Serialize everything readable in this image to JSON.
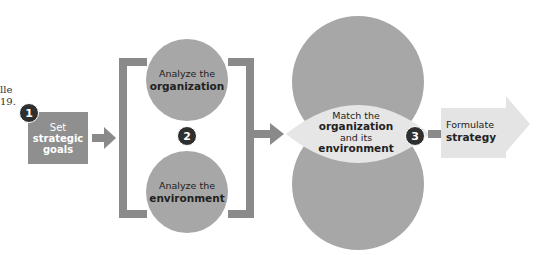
{
  "side_note": {
    "line1": "lle",
    "line2": "19."
  },
  "steps": [
    {
      "number": "1",
      "line1": "Set",
      "line2": "strategic",
      "line3": "goals"
    },
    {
      "number": "2",
      "top": {
        "line1": "Analyze the",
        "line2": "organization"
      },
      "bottom": {
        "line1": "Analyze the",
        "line2": "environment"
      }
    },
    {
      "number": "3",
      "line1": "Match the",
      "line2": "organization",
      "line3": "and its",
      "line4": "environment"
    },
    {
      "line1": "Formulate",
      "line2": "strategy"
    }
  ],
  "colors": {
    "box": "#8f8f8f",
    "circle": "#a7a7a7",
    "lens": "#e6e6e6",
    "connector": "#8a8a8a",
    "badge": "#2f2f2f",
    "final_arrow": "#e4e4e4"
  }
}
